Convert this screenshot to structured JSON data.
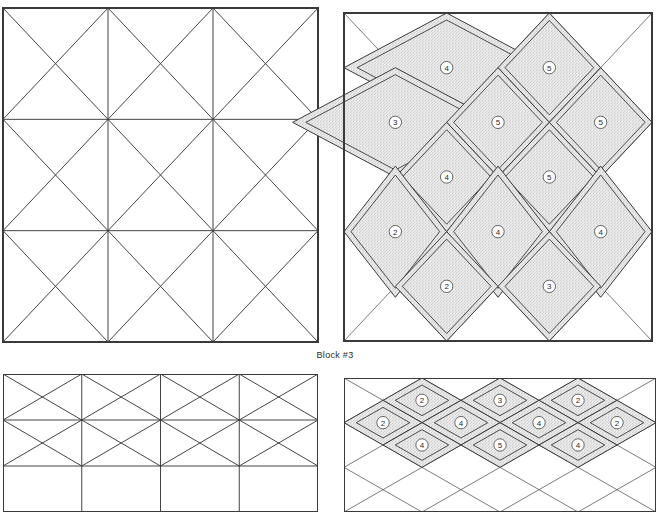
{
  "figure": {
    "caption_block3": "Block #3",
    "line_color": "#3a3a3a",
    "fill_color": "#ececec",
    "stipple_color": "#9a9a9a",
    "background": "#ffffff"
  },
  "panels": {
    "top_left": {
      "name": "Block #3 piecing grid (top left)",
      "x": 3,
      "y": 8,
      "w": 315,
      "h": 334,
      "cols": 3,
      "rows": 3,
      "cell_w": 98,
      "cell_h": 99
    },
    "top_right": {
      "name": "Block #3 quilting diagram (top right)",
      "x": 344,
      "y": 13,
      "w": 308,
      "h": 328,
      "cols": 3,
      "rows": 3,
      "cell_w": 100,
      "cell_h": 103
    },
    "bottom_left": {
      "name": "Block #4 piecing grid (bottom left)",
      "x": 3,
      "y": 374,
      "w": 315,
      "h": 138,
      "cols": 4,
      "rows": 3,
      "cell_w": 78,
      "cell_h": 97
    },
    "bottom_right": {
      "name": "Block #4 quilting diagram (bottom right)",
      "x": 344,
      "y": 378,
      "w": 312,
      "h": 134,
      "cols": 4,
      "rows": 3,
      "cell_w": 78,
      "cell_h": 98
    }
  },
  "chart_data": {
    "type": "diagram",
    "title": "Block #3",
    "figures": [
      {
        "id": "block3-grid",
        "kind": "piecing-grid",
        "grid": "3x3",
        "cells": [
          {
            "row": 0,
            "col": 0,
            "diagonals": "both"
          },
          {
            "row": 0,
            "col": 1,
            "diagonals": "both"
          },
          {
            "row": 0,
            "col": 2,
            "diagonals": "both"
          },
          {
            "row": 1,
            "col": 0,
            "diagonals": "both"
          },
          {
            "row": 1,
            "col": 1,
            "diagonals": "both"
          },
          {
            "row": 1,
            "col": 2,
            "diagonals": "both"
          },
          {
            "row": 2,
            "col": 0,
            "diagonals": "both"
          },
          {
            "row": 2,
            "col": 1,
            "diagonals": "both"
          },
          {
            "row": 2,
            "col": 2,
            "diagonals": "both"
          }
        ]
      },
      {
        "id": "block3-motifs",
        "kind": "quilting-motif-diagram",
        "grid": "3x3",
        "motifs": [
          {
            "label": "4",
            "cx": 1.0,
            "cy": 0.5,
            "rx": 1.0,
            "ry": 0.5,
            "shape": "diamond"
          },
          {
            "label": "5",
            "cx": 2.0,
            "cy": 0.5,
            "rx": 0.5,
            "ry": 0.5,
            "shape": "diamond"
          },
          {
            "label": "3",
            "cx": 0.5,
            "cy": 1.0,
            "rx": 1.0,
            "ry": 0.5,
            "shape": "diamond"
          },
          {
            "label": "5",
            "cx": 1.5,
            "cy": 1.0,
            "rx": 0.5,
            "ry": 0.5,
            "shape": "diamond"
          },
          {
            "label": "5",
            "cx": 2.5,
            "cy": 1.0,
            "rx": 0.5,
            "ry": 0.5,
            "shape": "diamond"
          },
          {
            "label": "4",
            "cx": 1.0,
            "cy": 1.5,
            "rx": 0.5,
            "ry": 0.5,
            "shape": "diamond"
          },
          {
            "label": "5",
            "cx": 2.0,
            "cy": 1.5,
            "rx": 0.5,
            "ry": 0.5,
            "shape": "diamond"
          },
          {
            "label": "2",
            "cx": 0.5,
            "cy": 2.0,
            "rx": 0.5,
            "ry": 0.6,
            "shape": "diamond"
          },
          {
            "label": "4",
            "cx": 1.5,
            "cy": 2.0,
            "rx": 0.5,
            "ry": 0.6,
            "shape": "diamond"
          },
          {
            "label": "4",
            "cx": 2.5,
            "cy": 2.0,
            "rx": 0.5,
            "ry": 0.6,
            "shape": "diamond"
          },
          {
            "label": "2",
            "cx": 1.0,
            "cy": 2.5,
            "rx": 0.5,
            "ry": 0.5,
            "shape": "diamond"
          },
          {
            "label": "3",
            "cx": 2.0,
            "cy": 2.5,
            "rx": 0.5,
            "ry": 0.5,
            "shape": "diamond"
          }
        ]
      },
      {
        "id": "block4-grid",
        "kind": "piecing-grid",
        "grid": "4x3",
        "cells": [
          {
            "row": 0,
            "col": 0,
            "diagonals": "both"
          },
          {
            "row": 0,
            "col": 1,
            "diagonals": "both"
          },
          {
            "row": 0,
            "col": 2,
            "diagonals": "both"
          },
          {
            "row": 0,
            "col": 3,
            "diagonals": "both"
          },
          {
            "row": 1,
            "col": 0,
            "diagonals": "both"
          },
          {
            "row": 1,
            "col": 1,
            "diagonals": "both"
          },
          {
            "row": 1,
            "col": 2,
            "diagonals": "both"
          },
          {
            "row": 1,
            "col": 3,
            "diagonals": "both"
          }
        ]
      },
      {
        "id": "block4-motifs",
        "kind": "quilting-motif-diagram",
        "grid": "4x3",
        "motifs": [
          {
            "label": "2",
            "cx": 1.0,
            "cy": 0.5,
            "rx": 0.5,
            "ry": 0.5,
            "shape": "diamond"
          },
          {
            "label": "3",
            "cx": 2.0,
            "cy": 0.5,
            "rx": 0.5,
            "ry": 0.5,
            "shape": "diamond"
          },
          {
            "label": "2",
            "cx": 3.0,
            "cy": 0.5,
            "rx": 0.5,
            "ry": 0.5,
            "shape": "diamond"
          },
          {
            "label": "2",
            "cx": 0.5,
            "cy": 1.0,
            "rx": 0.5,
            "ry": 0.5,
            "shape": "diamond"
          },
          {
            "label": "4",
            "cx": 1.5,
            "cy": 1.0,
            "rx": 0.5,
            "ry": 0.5,
            "shape": "diamond"
          },
          {
            "label": "4",
            "cx": 2.5,
            "cy": 1.0,
            "rx": 0.5,
            "ry": 0.5,
            "shape": "diamond"
          },
          {
            "label": "2",
            "cx": 3.5,
            "cy": 1.0,
            "rx": 0.5,
            "ry": 0.5,
            "shape": "diamond"
          },
          {
            "label": "4",
            "cx": 1.0,
            "cy": 1.5,
            "rx": 0.5,
            "ry": 0.5,
            "shape": "diamond"
          },
          {
            "label": "5",
            "cx": 2.0,
            "cy": 1.5,
            "rx": 0.5,
            "ry": 0.5,
            "shape": "diamond"
          },
          {
            "label": "4",
            "cx": 3.0,
            "cy": 1.5,
            "rx": 0.5,
            "ry": 0.5,
            "shape": "diamond"
          }
        ]
      }
    ]
  }
}
